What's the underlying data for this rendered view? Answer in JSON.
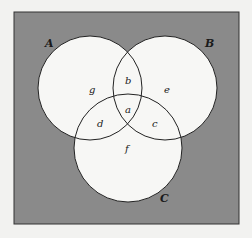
{
  "diagram": {
    "type": "venn",
    "universe_fill": "#8a8a8a",
    "circle_fill": "#f7f7f5",
    "stroke": "#222222",
    "sets": [
      {
        "name": "A",
        "cx": 90,
        "cy": 88,
        "r": 52
      },
      {
        "name": "B",
        "cx": 165,
        "cy": 88,
        "r": 52
      },
      {
        "name": "C",
        "cx": 128,
        "cy": 148,
        "r": 54
      }
    ],
    "set_labels": {
      "A": "A",
      "B": "B",
      "C": "C"
    },
    "regions": {
      "a": "a",
      "b": "b",
      "c": "c",
      "d": "d",
      "e": "e",
      "f": "f",
      "g": "g"
    }
  }
}
